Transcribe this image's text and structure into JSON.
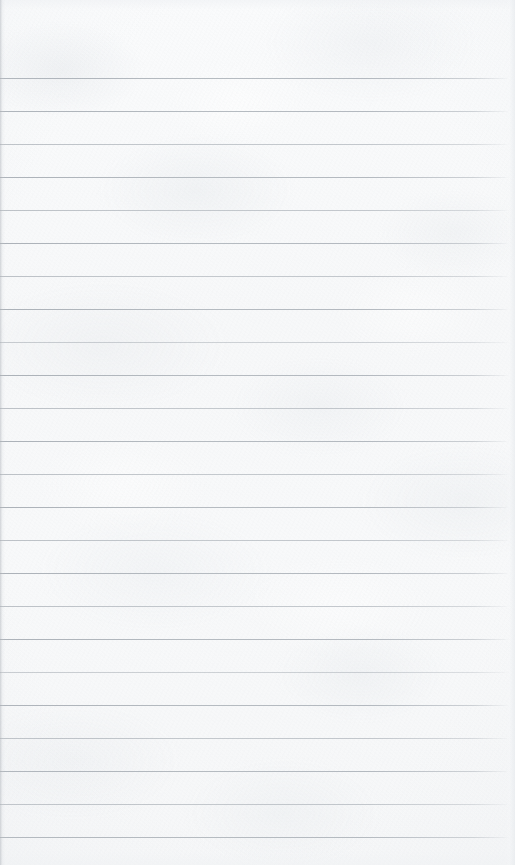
{
  "document": {
    "kind": "scanned-ruled-notebook-paper",
    "title": "",
    "body_text": "",
    "has_handwriting": false,
    "has_printed_text": false,
    "page_width": 515,
    "page_height": 865
  },
  "paper": {
    "background_color": "#f8f9fa",
    "highlight_color": "#fdfefe",
    "shadow_color": "#e3e6e9",
    "texture": "mottled fibre grain",
    "left_edge_color": "#aeb4ba"
  },
  "ruling": {
    "style": "horizontal rules only",
    "rule_color": "#b0b6bd",
    "rule_thickness_px": 1,
    "spacing_px": 33,
    "first_rule_y": 78,
    "last_rule_y": 837,
    "rule_start_x": 0,
    "rule_end_x": 509,
    "top_margin_px": 78,
    "bottom_margin_px": 28,
    "margin_rule": "none",
    "count": 24,
    "rules": [
      {
        "y": 78,
        "weight": "strong"
      },
      {
        "y": 111,
        "weight": "strong"
      },
      {
        "y": 144,
        "weight": "faint"
      },
      {
        "y": 177,
        "weight": "strong"
      },
      {
        "y": 210,
        "weight": "faint"
      },
      {
        "y": 243,
        "weight": "strong"
      },
      {
        "y": 276,
        "weight": "faint"
      },
      {
        "y": 309,
        "weight": "strong"
      },
      {
        "y": 342,
        "weight": "fainter"
      },
      {
        "y": 375,
        "weight": "strong"
      },
      {
        "y": 408,
        "weight": "faint"
      },
      {
        "y": 441,
        "weight": "strong"
      },
      {
        "y": 474,
        "weight": "faint"
      },
      {
        "y": 507,
        "weight": "strong"
      },
      {
        "y": 540,
        "weight": "faint"
      },
      {
        "y": 573,
        "weight": "strong"
      },
      {
        "y": 606,
        "weight": "faint"
      },
      {
        "y": 639,
        "weight": "strong"
      },
      {
        "y": 672,
        "weight": "fainter"
      },
      {
        "y": 705,
        "weight": "strong"
      },
      {
        "y": 738,
        "weight": "faint"
      },
      {
        "y": 771,
        "weight": "strong"
      },
      {
        "y": 804,
        "weight": "faint"
      },
      {
        "y": 837,
        "weight": "strong"
      }
    ]
  }
}
